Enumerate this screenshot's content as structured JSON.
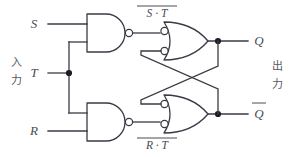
{
  "diagram": {
    "colors": {
      "wire": "#3a3a46",
      "label": "#4a4a55",
      "background": "#ffffff",
      "junction": "#1d1d23"
    }
  },
  "inputs": {
    "group_label": "入力",
    "group_label_chars": [
      "入",
      "力"
    ],
    "signals": [
      {
        "name": "S",
        "label": "S"
      },
      {
        "name": "T",
        "label": "T"
      },
      {
        "name": "R",
        "label": "R"
      }
    ]
  },
  "outputs": {
    "group_label": "出力",
    "group_label_chars": [
      "出",
      "力"
    ],
    "signals": [
      {
        "name": "Q",
        "label": "Q",
        "overbar": false
      },
      {
        "name": "Q-not",
        "label": "Q",
        "overbar": true
      }
    ]
  },
  "intermediate_labels": [
    {
      "name": "top-nand-output",
      "base": "S · T",
      "overbar": true,
      "text": "S · T"
    },
    {
      "name": "bottom-nand-output",
      "base": "R · T",
      "overbar": true,
      "text": "R · T"
    }
  ],
  "gates": [
    {
      "name": "nand-gate-top",
      "type": "NAND",
      "inputs": [
        "S",
        "T"
      ],
      "output_label": "S · T"
    },
    {
      "name": "nand-gate-bottom",
      "type": "NAND",
      "inputs": [
        "R",
        "T"
      ],
      "output_label": "R · T"
    },
    {
      "name": "or-gate-top",
      "type": "OR-negated-inputs",
      "inputs": [
        "S · T",
        "Q-not"
      ],
      "output_label": "Q"
    },
    {
      "name": "or-gate-bottom",
      "type": "OR-negated-inputs",
      "inputs": [
        "Q",
        "R · T"
      ],
      "output_label": "Q-not"
    }
  ]
}
